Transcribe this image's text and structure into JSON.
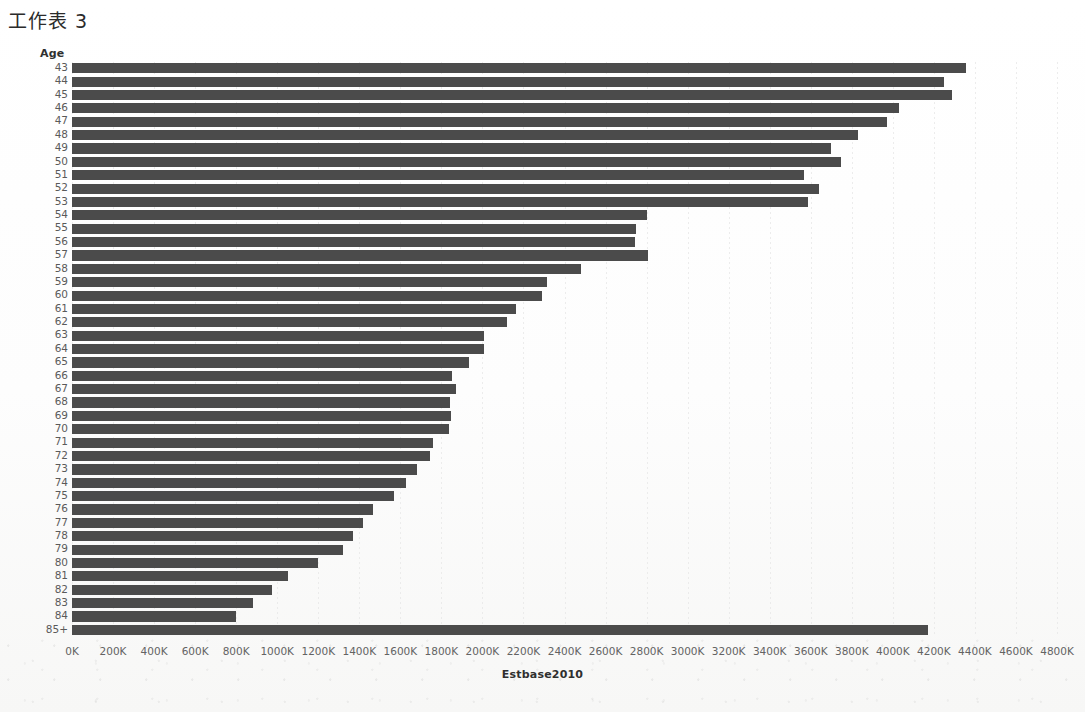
{
  "sheet": {
    "title": "工作表 3"
  },
  "chart_data": {
    "type": "bar",
    "orientation": "horizontal",
    "title": "",
    "xlabel": "Estbase2010",
    "ylabel": "Age",
    "xlim": [
      0,
      4800000
    ],
    "xtick_step": 200000,
    "xtick_labels": [
      "0K",
      "200K",
      "400K",
      "600K",
      "800K",
      "1000K",
      "1200K",
      "1400K",
      "1600K",
      "1800K",
      "2000K",
      "2200K",
      "2400K",
      "2600K",
      "2800K",
      "3000K",
      "3200K",
      "3400K",
      "3600K",
      "3800K",
      "4000K",
      "4200K",
      "4400K",
      "4600K",
      "4800K"
    ],
    "xtick_values": [
      0,
      200000,
      400000,
      600000,
      800000,
      1000000,
      1200000,
      1400000,
      1600000,
      1800000,
      2000000,
      2200000,
      2400000,
      2600000,
      2800000,
      3000000,
      3200000,
      3400000,
      3600000,
      3800000,
      4000000,
      4200000,
      4400000,
      4600000,
      4800000
    ],
    "grid": "vertical-dotted",
    "legend": "none",
    "bar_color": "#4b4b4b",
    "categories": [
      "43",
      "44",
      "45",
      "46",
      "47",
      "48",
      "49",
      "50",
      "51",
      "52",
      "53",
      "54",
      "55",
      "56",
      "57",
      "58",
      "59",
      "60",
      "61",
      "62",
      "63",
      "64",
      "65",
      "66",
      "67",
      "68",
      "69",
      "70",
      "71",
      "72",
      "73",
      "74",
      "75",
      "76",
      "77",
      "78",
      "79",
      "80",
      "81",
      "82",
      "83",
      "84",
      "85+"
    ],
    "values": [
      4355000,
      4250000,
      4290000,
      4030000,
      3970000,
      3830000,
      3700000,
      3745000,
      3565000,
      3640000,
      3585000,
      2800000,
      2750000,
      2745000,
      2805000,
      2480000,
      2315000,
      2290000,
      2165000,
      2120000,
      2010000,
      2010000,
      1935000,
      1850000,
      1870000,
      1840000,
      1845000,
      1835000,
      1760000,
      1745000,
      1680000,
      1630000,
      1570000,
      1465000,
      1420000,
      1370000,
      1320000,
      1200000,
      1055000,
      975000,
      880000,
      800000,
      4170000
    ]
  }
}
